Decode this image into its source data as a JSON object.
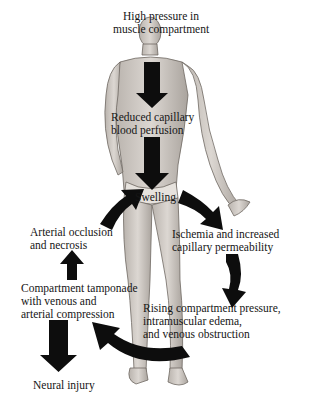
{
  "diagram": {
    "nodes": [
      {
        "id": "high_pressure",
        "lines": [
          "High pressure in",
          "muscle compartment"
        ]
      },
      {
        "id": "reduced_perfusion",
        "lines": [
          "Reduced capillary",
          "blood perfusion"
        ]
      },
      {
        "id": "swelling",
        "lines": [
          "Swelling"
        ]
      },
      {
        "id": "ischemia",
        "lines": [
          "Ischemia and increased",
          "capillary permeability"
        ]
      },
      {
        "id": "rising_pressure",
        "lines": [
          "Rising compartment pressure,",
          "intramuscular edema,",
          "and venous obstruction"
        ]
      },
      {
        "id": "tamponade",
        "lines": [
          "Compartment tamponade",
          "with venous and",
          "arterial compression"
        ]
      },
      {
        "id": "arterial_occlusion",
        "lines": [
          "Arterial occlusion",
          "and necrosis"
        ]
      },
      {
        "id": "neural_injury",
        "lines": [
          "Neural injury"
        ]
      }
    ],
    "edges": [
      {
        "from": "high_pressure",
        "to": "reduced_perfusion"
      },
      {
        "from": "reduced_perfusion",
        "to": "swelling"
      },
      {
        "from": "swelling",
        "to": "ischemia"
      },
      {
        "from": "ischemia",
        "to": "rising_pressure"
      },
      {
        "from": "rising_pressure",
        "to": "tamponade"
      },
      {
        "from": "tamponade",
        "to": "arterial_occlusion"
      },
      {
        "from": "arterial_occlusion",
        "to": "swelling"
      },
      {
        "from": "tamponade",
        "to": "neural_injury"
      }
    ],
    "colors": {
      "arrow": "#0d0d0d",
      "text": "#151515",
      "figure_fill": "#d2cdc8",
      "figure_shade": "#a59f99",
      "background": "#ffffff"
    }
  }
}
